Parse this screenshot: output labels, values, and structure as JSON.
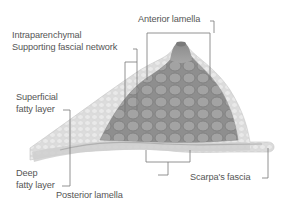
{
  "diagram": {
    "labels": {
      "anterior_lamella": "Anterior lamella",
      "intraparenchymal_line1": "Intraparenchymal",
      "intraparenchymal_line2": "Supporting fascial network",
      "superficial_line1": "Superficial",
      "superficial_line2": "fatty layer",
      "deep_line1": "Deep",
      "deep_line2": "fatty layer",
      "posterior_lamella": "Posterior lamella",
      "scarpas_fascia": "Scarpa's fascia"
    },
    "colors": {
      "background": "#ffffff",
      "label_text": "#555555",
      "leader_line": "#777777",
      "fat_layer": "#d9d9d9",
      "gland": "#9a9a9a",
      "gland_dark": "#7c7c7c",
      "fascia": "#bdbdbd"
    }
  }
}
